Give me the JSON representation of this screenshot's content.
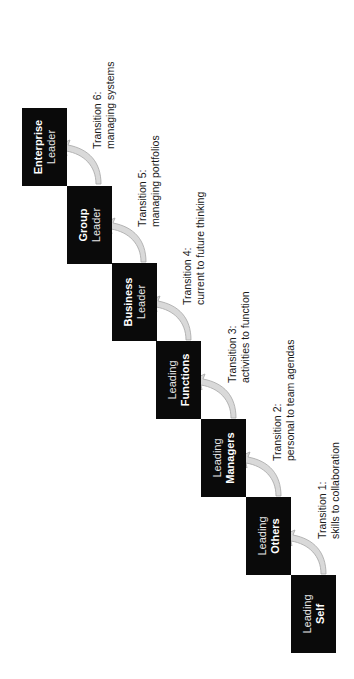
{
  "diagram": {
    "orientation": "rotated -90deg",
    "colors": {
      "box_fill": "#0a0a0a",
      "box_text": "#ffffff",
      "arrow_fill": "#d9d9d9",
      "arrow_stroke": "#a6a6a6",
      "label_text": "#1a1a1a",
      "background": "#ffffff"
    },
    "stages": [
      {
        "line1": "Leading",
        "line2": "Self",
        "bold_line": 2
      },
      {
        "line1": "Leading",
        "line2": "Others",
        "bold_line": 2
      },
      {
        "line1": "Leading",
        "line2": "Managers",
        "bold_line": 2
      },
      {
        "line1": "Leading",
        "line2": "Functions",
        "bold_line": 2
      },
      {
        "line1": "Business",
        "line2": "Leader",
        "bold_line": 1
      },
      {
        "line1": "Group",
        "line2": "Leader",
        "bold_line": 1
      },
      {
        "line1": "Enterprise",
        "line2": "Leader",
        "bold_line": 1
      }
    ],
    "transitions": [
      {
        "title": "Transition 1:",
        "desc": "skills to collaboration"
      },
      {
        "title": "Transition 2:",
        "desc": "personal to team agendas"
      },
      {
        "title": "Transition 3:",
        "desc": "activities to function"
      },
      {
        "title": "Transition 4:",
        "desc": "current to future thinking"
      },
      {
        "title": "Transition 5:",
        "desc": "managing portfolios"
      },
      {
        "title": "Transition 6:",
        "desc": "managing systems"
      }
    ]
  }
}
